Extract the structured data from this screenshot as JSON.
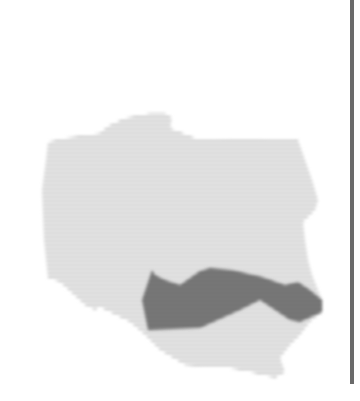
{
  "map": {
    "country": {
      "name": "Poland",
      "fill_stripe_light": "#ffffff",
      "fill_stripe_dark": "#b8b8b8",
      "outline": [
        [
          48,
          142
        ],
        [
          65,
          138
        ],
        [
          100,
          133
        ],
        [
          108,
          126
        ],
        [
          125,
          118
        ],
        [
          150,
          113
        ],
        [
          165,
          113
        ],
        [
          172,
          118
        ],
        [
          170,
          128
        ],
        [
          185,
          134
        ],
        [
          195,
          138
        ],
        [
          230,
          140
        ],
        [
          260,
          140
        ],
        [
          285,
          138
        ],
        [
          298,
          140
        ],
        [
          305,
          160
        ],
        [
          312,
          180
        ],
        [
          318,
          200
        ],
        [
          315,
          210
        ],
        [
          303,
          222
        ],
        [
          305,
          240
        ],
        [
          308,
          260
        ],
        [
          312,
          275
        ],
        [
          318,
          290
        ],
        [
          322,
          300
        ],
        [
          322,
          312
        ],
        [
          310,
          322
        ],
        [
          300,
          335
        ],
        [
          290,
          345
        ],
        [
          280,
          358
        ],
        [
          285,
          372
        ],
        [
          275,
          378
        ],
        [
          250,
          372
        ],
        [
          230,
          368
        ],
        [
          215,
          368
        ],
        [
          185,
          365
        ],
        [
          160,
          350
        ],
        [
          145,
          335
        ],
        [
          130,
          322
        ],
        [
          100,
          307
        ],
        [
          95,
          310
        ],
        [
          85,
          305
        ],
        [
          60,
          282
        ],
        [
          48,
          278
        ],
        [
          44,
          240
        ],
        [
          42,
          190
        ],
        [
          46,
          160
        ]
      ]
    },
    "highlighted_region": {
      "fill_stripe_light": "#8a8a8a",
      "fill_stripe_dark": "#5a5a5a",
      "outline": [
        [
          155,
          275
        ],
        [
          165,
          280
        ],
        [
          180,
          285
        ],
        [
          200,
          271
        ],
        [
          210,
          268
        ],
        [
          232,
          270
        ],
        [
          262,
          277
        ],
        [
          285,
          285
        ],
        [
          298,
          282
        ],
        [
          310,
          290
        ],
        [
          322,
          300
        ],
        [
          322,
          312
        ],
        [
          300,
          322
        ],
        [
          290,
          320
        ],
        [
          260,
          300
        ],
        [
          240,
          310
        ],
        [
          200,
          328
        ],
        [
          148,
          330
        ],
        [
          142,
          300
        ],
        [
          152,
          270
        ]
      ]
    },
    "divider_color": "#6a6a6a"
  }
}
